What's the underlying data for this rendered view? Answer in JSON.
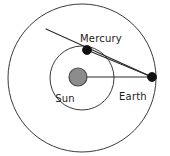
{
  "diagram": {
    "background_color": "#ffffff",
    "orbit_stroke_color": "#3a3a3a",
    "line_stroke_color": "#2b2b2b",
    "sun_fill_color": "#8c8c8c",
    "sun_stroke_color": "#4a4a4a",
    "dot_fill_color": "#111111",
    "label_color": "#1c1c1c"
  },
  "labels": {
    "mercury": "Mercury",
    "sun": "Sun",
    "earth": "Earth"
  },
  "orbits": [
    {
      "name": "earth-orbit",
      "cx": 82,
      "cy": 78,
      "r": 74
    },
    {
      "name": "mercury-orbit",
      "cx": 82,
      "cy": 78,
      "r": 32
    }
  ],
  "bodies": [
    {
      "name": "sun",
      "cx": 78,
      "cy": 77,
      "r": 9
    },
    {
      "name": "mercury",
      "cx": 87,
      "cy": 50,
      "r": 4.5
    },
    {
      "name": "earth",
      "cx": 152,
      "cy": 77,
      "r": 4.5
    }
  ],
  "sight_lines": [
    {
      "name": "sun-earth-line",
      "x1": 78,
      "y1": 77,
      "x2": 152,
      "y2": 77
    },
    {
      "name": "earth-mercury-line",
      "x1": 152,
      "y1": 77,
      "x2": 87,
      "y2": 50
    },
    {
      "name": "earth-tangent-line",
      "x1": 152,
      "y1": 77,
      "x2": 46,
      "y2": 29
    }
  ],
  "label_positions": {
    "mercury": {
      "x": 80,
      "y": 42
    },
    "sun": {
      "x": 65,
      "y": 102
    },
    "earth": {
      "x": 133,
      "y": 100
    }
  }
}
